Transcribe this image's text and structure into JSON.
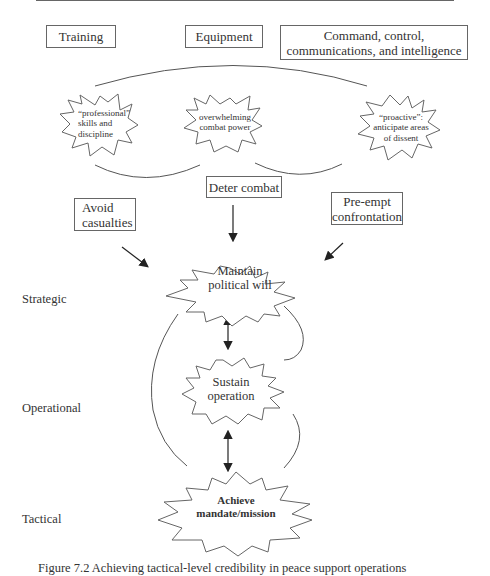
{
  "inputs": {
    "training": "Training",
    "equipment": "Equipment",
    "c3i": "Command, control, communications, and intelligence"
  },
  "qualities": {
    "professional": [
      "“professional”",
      "skills and",
      "discipline"
    ],
    "combat_power": [
      "overwhelming",
      "combat power"
    ],
    "proactive": [
      "“proactive”:",
      "anticipate areas",
      "of dissent"
    ]
  },
  "objectives": {
    "avoid_casualties": [
      "Avoid",
      "casualties"
    ],
    "deter_combat": "Deter combat",
    "preempt": [
      "Pre-empt",
      "confrontation"
    ]
  },
  "outcomes": {
    "political_will": [
      "Maintain",
      "political will"
    ],
    "sustain_operation": [
      "Sustain",
      "operation"
    ],
    "achieve_mandate": [
      "Achieve",
      "mandate/mission"
    ]
  },
  "levels": {
    "strategic": "Strategic",
    "operational": "Operational",
    "tactical": "Tactical"
  },
  "caption": "Figure 7.2  Achieving tactical-level credibility in peace support operations"
}
